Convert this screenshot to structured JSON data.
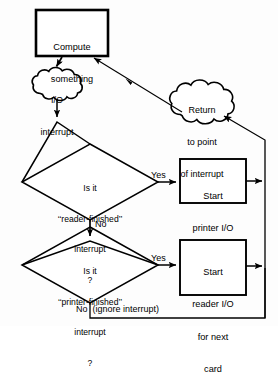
{
  "diagram": {
    "background_color": "#fdfdfd",
    "line_color": "#000000",
    "fill_color": "#ffffff",
    "nodes": {
      "compute": {
        "shape": "process-box",
        "line1": "Compute",
        "line2": "something"
      },
      "io_interrupt": {
        "shape": "cloud",
        "line1": "I/O",
        "line2": "interrupt"
      },
      "return_point": {
        "shape": "cloud",
        "line1": "Return",
        "line2": "to point",
        "line3": "of interrupt"
      },
      "decision_reader": {
        "shape": "diamond",
        "line1": "Is it",
        "line2": "‘‘reader-finished’’",
        "line3": "interrupt",
        "line4": "?"
      },
      "decision_printer": {
        "shape": "diamond",
        "line1": "Is it",
        "line2": "‘‘printer-finished’’",
        "line3": "interrupt",
        "line4": "?"
      },
      "start_printer": {
        "shape": "process-box",
        "line1": "Start",
        "line2": "printer I/O"
      },
      "start_reader": {
        "shape": "process-box",
        "line1": "Start",
        "line2": "reader I/O",
        "line3": "for next",
        "line4": "card"
      }
    },
    "edge_labels": {
      "yes_reader": "Yes",
      "no_reader": "No",
      "yes_printer": "Yes",
      "no_printer": "No  (ignore interrupt)"
    }
  }
}
